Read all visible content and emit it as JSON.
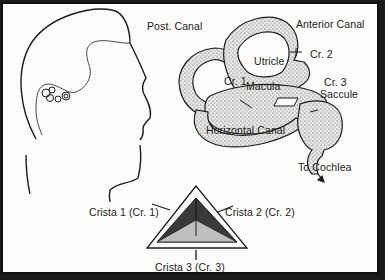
{
  "diagram": {
    "title": "",
    "panels": {
      "head_profile": {
        "description": "Side profile of a head showing location of inner ear"
      },
      "labyrinth": {
        "labels": {
          "post_canal": "Post. Canal",
          "anterior_canal": "Anterior Canal",
          "utricle": "Utricle",
          "cr2": "Cr. 2",
          "cr1": "Cr. 1",
          "macula": "Macula",
          "cr3": "Cr. 3",
          "saccule": "Saccule",
          "horizontal_canal": "Horizontal Canal",
          "to_cochlea": "To Cochlea"
        }
      },
      "crista_pyramid": {
        "labels": {
          "crista1": "Crista 1 (Cr. 1)",
          "crista2": "Crista 2 (Cr. 2)",
          "crista3": "Crista 3 (Cr. 3)"
        }
      }
    },
    "colors": {
      "background": "#fbfbf9",
      "border": "#111111",
      "line": "#1c1c1c",
      "stipple": "#bdbdbd",
      "pyramid_dark": "#3a3a3a",
      "pyramid_light": "#bfbfbf"
    }
  }
}
